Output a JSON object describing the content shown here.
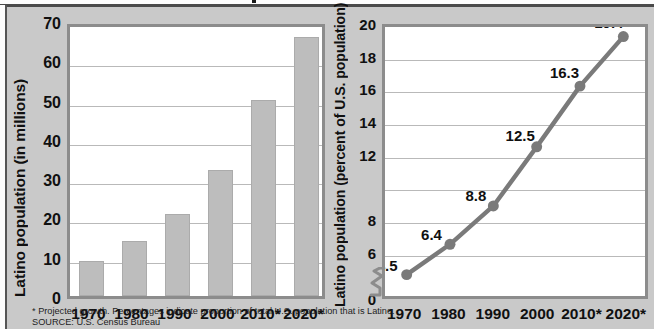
{
  "figure": {
    "background_color": "#c9c9c9",
    "plot_background": "#ffffff",
    "bar_color": "#bdbdbd",
    "line_color": "#7a7a7a",
    "frame_color": "#8c8c8c",
    "grid_color": "#b9b9b9"
  },
  "footnotes": {
    "note": "* Projected growth. Percentages indicate proportion of total U.S. population that is Latino.",
    "source": "SOURCE: U.S. Census Bureau"
  },
  "chart_data": [
    {
      "type": "bar",
      "title": "",
      "xlabel": "",
      "ylabel": "Latino population (in millions)",
      "categories": [
        "1970",
        "1980",
        "1990",
        "2000",
        "2010*",
        "2020*"
      ],
      "values": [
        9,
        14,
        21,
        32,
        50,
        66
      ],
      "ylim": [
        0,
        70
      ],
      "yticks": [
        0,
        10,
        20,
        30,
        40,
        50,
        60,
        70
      ],
      "ytick_labels": [
        "0",
        "10",
        "20",
        "30",
        "40",
        "50",
        "60",
        "70"
      ],
      "grid": true,
      "legend": "none"
    },
    {
      "type": "line",
      "title": "",
      "xlabel": "",
      "ylabel": "Latino population (percent of U.S. population)",
      "categories": [
        "1970",
        "1980",
        "1990",
        "2000",
        "2010*",
        "2020*"
      ],
      "values": [
        4.5,
        6.4,
        8.8,
        12.5,
        16.3,
        19.4
      ],
      "point_labels": [
        "4.5",
        "6.4",
        "8.8",
        "12.5",
        "16.3",
        "19.4"
      ],
      "ylim": [
        0,
        20
      ],
      "yticks": [
        0,
        6,
        8,
        12,
        14,
        16,
        18,
        20
      ],
      "ytick_labels": [
        "0",
        "6",
        "8",
        "12",
        "14",
        "16",
        "18",
        "20"
      ],
      "axis_break": true,
      "axis_break_between": [
        0,
        6
      ],
      "grid": true,
      "markers": true,
      "legend": "none"
    }
  ]
}
